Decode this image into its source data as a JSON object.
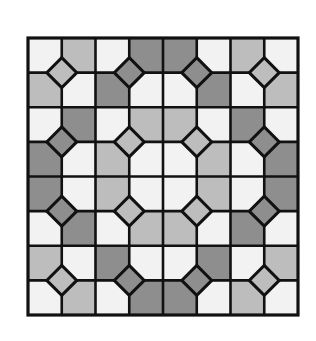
{
  "figure": {
    "title": "Octagon-and-square tile pattern",
    "grid": {
      "rows": 8,
      "cols": 8,
      "x": 28,
      "y": 38,
      "width": 270,
      "height": 277
    },
    "colors": {
      "W": "#f2f2f2",
      "L": "#bdbdbd",
      "D": "#8e8e8e",
      "line": "#111111",
      "background": "#ffffff"
    },
    "cells": [
      [
        "W",
        "L",
        "W",
        "D",
        "D",
        "W",
        "L",
        "W"
      ],
      [
        "L",
        "W",
        "D",
        "W",
        "W",
        "D",
        "W",
        "L"
      ],
      [
        "W",
        "D",
        "W",
        "L",
        "L",
        "W",
        "D",
        "W"
      ],
      [
        "D",
        "W",
        "L",
        "W",
        "W",
        "L",
        "W",
        "D"
      ],
      [
        "D",
        "W",
        "L",
        "W",
        "W",
        "L",
        "W",
        "D"
      ],
      [
        "W",
        "D",
        "W",
        "L",
        "L",
        "W",
        "D",
        "W"
      ],
      [
        "L",
        "W",
        "D",
        "W",
        "W",
        "D",
        "W",
        "L"
      ],
      [
        "W",
        "L",
        "W",
        "D",
        "D",
        "W",
        "L",
        "W"
      ]
    ],
    "diamond_half_diagonal": 15,
    "diamonds": [
      {
        "col": 1,
        "row": 1,
        "shade": "L"
      },
      {
        "col": 3,
        "row": 1,
        "shade": "D"
      },
      {
        "col": 5,
        "row": 1,
        "shade": "D"
      },
      {
        "col": 7,
        "row": 1,
        "shade": "L"
      },
      {
        "col": 1,
        "row": 3,
        "shade": "D"
      },
      {
        "col": 3,
        "row": 3,
        "shade": "L"
      },
      {
        "col": 5,
        "row": 3,
        "shade": "L"
      },
      {
        "col": 7,
        "row": 3,
        "shade": "D"
      },
      {
        "col": 1,
        "row": 5,
        "shade": "D"
      },
      {
        "col": 3,
        "row": 5,
        "shade": "L"
      },
      {
        "col": 5,
        "row": 5,
        "shade": "L"
      },
      {
        "col": 7,
        "row": 5,
        "shade": "D"
      },
      {
        "col": 1,
        "row": 7,
        "shade": "L"
      },
      {
        "col": 3,
        "row": 7,
        "shade": "D"
      },
      {
        "col": 5,
        "row": 7,
        "shade": "D"
      },
      {
        "col": 7,
        "row": 7,
        "shade": "L"
      }
    ]
  }
}
